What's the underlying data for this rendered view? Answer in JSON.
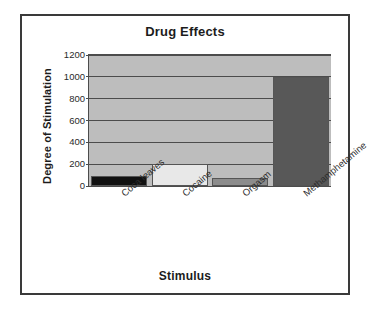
{
  "figure": {
    "title": "Drug Effects",
    "xlabel": "Stimulus",
    "ylabel": "Degree of Stimulation",
    "frame_color": "#3a3a3a",
    "plot_background": "#bdbdbd",
    "gridline_color": "#4c4c4c"
  },
  "chart_data": {
    "type": "bar",
    "title": "Drug Effects",
    "xlabel": "Stimulus",
    "ylabel": "Degree of Stimulation",
    "categories": [
      "Coca leaves",
      "Cocaine",
      "Orgasm",
      "Methamphetamine"
    ],
    "values": [
      90,
      200,
      70,
      1000
    ],
    "bar_colors": [
      "#111111",
      "#e8e8e8",
      "#8c8c8c",
      "#585858"
    ],
    "ylim": [
      0,
      1200
    ],
    "yticks": [
      0,
      200,
      400,
      600,
      800,
      1000,
      1200
    ],
    "ytick_labels": [
      "0",
      "200",
      "400",
      "600",
      "800",
      "1000",
      "1200"
    ],
    "grid": true,
    "legend": "none"
  }
}
